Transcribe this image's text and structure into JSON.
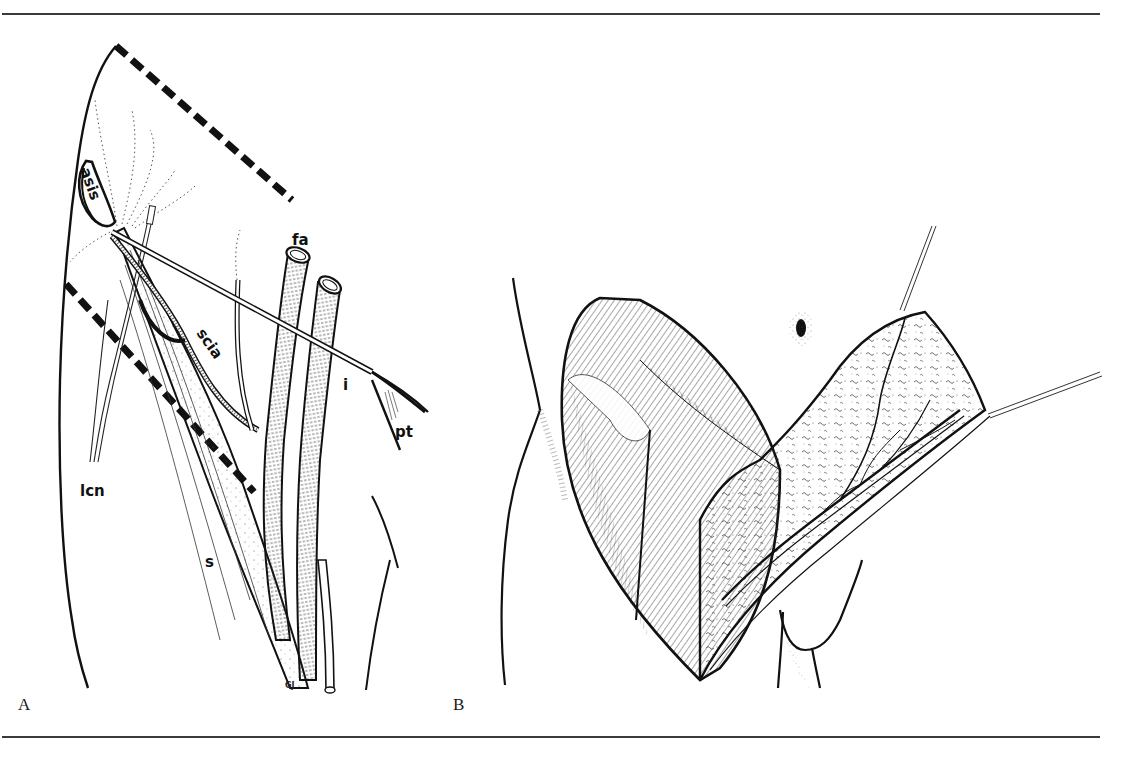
{
  "figure": {
    "panels": [
      {
        "id": "A",
        "letter": "A",
        "labels": {
          "asis": "asis",
          "fa": "fa",
          "scia": "scia",
          "i": "i",
          "pt": "pt",
          "lcn": "lcn",
          "s": "s"
        },
        "artist_signature": "GJ",
        "description": "Groin flap outline (dashed) over anterior superior iliac spine, femoral artery, superficial circumflex iliac artery, inguinal ligament, pubic tubercle, lateral cutaneous nerve and sartorius"
      },
      {
        "id": "B",
        "letter": "B",
        "description": "Elevated groin flap retracted with sutures, showing vascular pedicle on undersurface"
      }
    ],
    "colors": {
      "ink": "#111111",
      "rule": "#3a3a3a",
      "background": "#ffffff"
    }
  }
}
